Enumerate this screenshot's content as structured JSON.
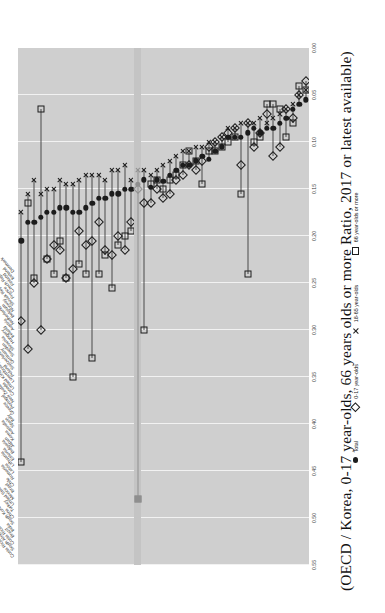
{
  "figure": {
    "title": "(OECD / Korea, 0-17 year-olds, 66 years olds or more Ratio, 2017 or latest available)"
  },
  "legend": {
    "position": "bottom",
    "items": [
      {
        "key": "total",
        "label": "Total",
        "marker": "filled-circle"
      },
      {
        "key": "y017",
        "label": "0-17 year-olds",
        "marker": "open-diamond"
      },
      {
        "key": "y1865",
        "label": "18-65 year-olds",
        "marker": "x-cross"
      },
      {
        "key": "y66",
        "label": "66 year-olds or more",
        "marker": "open-square"
      }
    ]
  },
  "chart_data": {
    "type": "scatter",
    "title": "(OECD / Korea, 0-17 year-olds, 66 years olds or more Ratio, 2017 or latest available)",
    "xlabel": "",
    "ylabel": "",
    "orientation": "horizontal-dot-plot",
    "x_reversed": true,
    "xlim": [
      0.0,
      0.55
    ],
    "xticks": [
      "0.00",
      "0.05",
      "0.10",
      "0.15",
      "0.20",
      "0.25",
      "0.30",
      "0.35",
      "0.40",
      "0.45",
      "0.50",
      "0.55"
    ],
    "grid": true,
    "highlight_category": "Korea",
    "series_names": [
      "Total",
      "0-17 year-olds",
      "18-65 year-olds",
      "66 year-olds or more"
    ],
    "categories": [
      "Costa Rica (latest available)",
      "South Africa",
      "Costa Rica",
      "Brazil",
      "India",
      "South Korea",
      "China",
      "Turkey",
      "United States",
      "Mexico",
      "Israel",
      "Chile",
      "Romania",
      "Latvia",
      "Lithuania",
      "Estonia",
      "Bulgaria",
      "Japan",
      "Korea",
      "Australia",
      "Spain",
      "Italy",
      "Greece",
      "Portugal",
      "New Zealand",
      "Canada",
      "United Kingdom",
      "Luxembourg",
      "Poland",
      "Switzerland",
      "Germany",
      "Sweden",
      "Slovenia",
      "Hungary",
      "Ireland",
      "Austria",
      "Netherlands",
      "Belgium",
      "Norway",
      "Slovak Republic",
      "France",
      "Czech Republic",
      "Finland",
      "Iceland",
      "Denmark"
    ],
    "series": [
      {
        "name": "Total",
        "marker": "filled-circle",
        "values": [
          0.205,
          0.185,
          0.185,
          0.18,
          0.175,
          0.175,
          0.17,
          0.17,
          0.175,
          0.175,
          0.17,
          0.165,
          0.16,
          0.16,
          0.155,
          0.155,
          0.15,
          0.15,
          0.145,
          0.14,
          0.148,
          0.14,
          0.142,
          0.135,
          0.13,
          0.125,
          0.125,
          0.12,
          0.115,
          0.118,
          0.11,
          0.105,
          0.095,
          0.095,
          0.095,
          0.09,
          0.085,
          0.09,
          0.085,
          0.085,
          0.08,
          0.075,
          0.065,
          0.06,
          0.055
        ]
      },
      {
        "name": "0-17 year-olds",
        "marker": "open-diamond",
        "values": [
          0.29,
          0.32,
          0.25,
          0.3,
          0.225,
          0.21,
          0.215,
          0.245,
          0.235,
          0.195,
          0.21,
          0.205,
          0.185,
          0.215,
          0.22,
          0.2,
          0.215,
          0.185,
          0.15,
          0.165,
          0.165,
          0.15,
          0.16,
          0.155,
          0.14,
          0.135,
          0.125,
          0.13,
          0.12,
          0.105,
          0.1,
          0.095,
          0.09,
          0.085,
          0.125,
          0.08,
          0.105,
          0.09,
          0.07,
          0.115,
          0.105,
          0.065,
          0.075,
          0.05,
          0.035
        ]
      },
      {
        "name": "18-65 year-olds",
        "marker": "x-cross",
        "values": [
          0.175,
          0.155,
          0.14,
          0.155,
          0.15,
          0.15,
          0.14,
          0.145,
          0.145,
          0.14,
          0.135,
          0.135,
          0.135,
          0.14,
          0.13,
          0.13,
          0.125,
          0.14,
          0.13,
          0.13,
          0.135,
          0.13,
          0.125,
          0.12,
          0.115,
          0.11,
          0.11,
          0.105,
          0.105,
          0.1,
          0.1,
          0.095,
          0.085,
          0.085,
          0.08,
          0.08,
          0.08,
          0.075,
          0.08,
          0.075,
          0.07,
          0.065,
          0.06,
          0.05,
          0.045
        ]
      },
      {
        "name": "66 year-olds or more",
        "marker": "open-square",
        "values": [
          0.44,
          0.165,
          0.245,
          0.065,
          0.225,
          0.24,
          0.205,
          0.245,
          0.35,
          0.23,
          0.24,
          0.33,
          0.24,
          0.22,
          0.255,
          0.21,
          0.2,
          0.195,
          0.48,
          0.3,
          0.145,
          0.14,
          0.15,
          0.14,
          0.135,
          0.125,
          0.11,
          0.12,
          0.145,
          0.11,
          0.11,
          0.105,
          0.1,
          0.095,
          0.155,
          0.24,
          0.1,
          0.095,
          0.06,
          0.06,
          0.065,
          0.095,
          0.08,
          0.04,
          0.045
        ]
      }
    ]
  }
}
